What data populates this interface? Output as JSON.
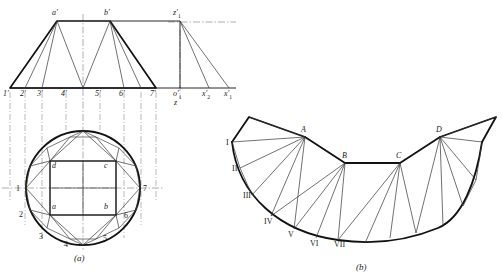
{
  "figure": {
    "title_a": "(a)",
    "title_b": "(b)"
  },
  "colors": {
    "outline": "#111111",
    "thin": "#333333",
    "center": "#555555",
    "background": "#ffffff"
  },
  "view_a": {
    "front_view": {
      "apex_labels": [
        "a′",
        "b′"
      ],
      "base_labels": [
        "1′",
        "2′",
        "3′",
        "4′",
        "5′",
        "6′",
        "7′"
      ]
    },
    "aux_view": {
      "top_label": "z′",
      "top_label_sub": "1",
      "base_labels": [
        {
          "text": "o′",
          "sub": "1"
        },
        {
          "text": "x′",
          "sub": "2"
        },
        {
          "text": "x′",
          "sub": "1"
        }
      ],
      "axis_label": "z"
    },
    "top_view": {
      "circle_labels": [
        "1",
        "2",
        "3",
        "4",
        "5",
        "6",
        "7"
      ],
      "square_labels": [
        "a",
        "b",
        "c",
        "d"
      ]
    }
  },
  "view_b": {
    "upper_labels": [
      "A",
      "B",
      "C",
      "D"
    ],
    "roman_labels": [
      "I",
      "II",
      "III",
      "IV",
      "V",
      "VI",
      "VII"
    ]
  }
}
